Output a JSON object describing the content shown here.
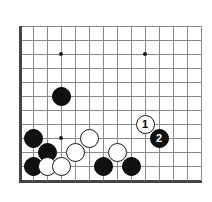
{
  "board": {
    "origin_x": 19,
    "origin_y": 26,
    "cell": 14,
    "cols": 14,
    "rows": 12,
    "line_color": "#8a8a8a",
    "edge_color": "#444444",
    "background": "#ffffff"
  },
  "star_points": [
    {
      "col": 3,
      "row": 2
    },
    {
      "col": 9,
      "row": 2
    },
    {
      "col": 3,
      "row": 8
    }
  ],
  "stones": [
    {
      "name": "black-stone-d6",
      "color": "black",
      "col": 3,
      "row": 5,
      "label": ""
    },
    {
      "name": "black-stone-b3",
      "color": "black",
      "col": 1,
      "row": 8,
      "label": ""
    },
    {
      "name": "black-stone-c2",
      "color": "black",
      "col": 2,
      "row": 9,
      "label": ""
    },
    {
      "name": "black-stone-b1",
      "color": "black",
      "col": 1,
      "row": 10,
      "label": ""
    },
    {
      "name": "white-stone-c1",
      "color": "white",
      "col": 2,
      "row": 10,
      "label": ""
    },
    {
      "name": "white-stone-d1",
      "color": "white",
      "col": 3,
      "row": 10,
      "label": ""
    },
    {
      "name": "white-stone-e2",
      "color": "white",
      "col": 4,
      "row": 9,
      "label": ""
    },
    {
      "name": "white-stone-f3",
      "color": "white",
      "col": 5,
      "row": 8,
      "label": ""
    },
    {
      "name": "black-stone-g1",
      "color": "black",
      "col": 6,
      "row": 10,
      "label": ""
    },
    {
      "name": "white-stone-h2",
      "color": "white",
      "col": 7,
      "row": 9,
      "label": ""
    },
    {
      "name": "black-stone-j1",
      "color": "black",
      "col": 8,
      "row": 10,
      "label": ""
    },
    {
      "name": "white-stone-move-1",
      "color": "white",
      "col": 9,
      "row": 7,
      "label": "1"
    },
    {
      "name": "black-stone-move-2",
      "color": "black",
      "col": 10,
      "row": 8,
      "label": "2"
    }
  ],
  "moves": [
    {
      "number": "1",
      "color": "white"
    },
    {
      "number": "2",
      "color": "black"
    }
  ]
}
